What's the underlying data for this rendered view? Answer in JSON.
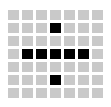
{
  "icon": {
    "name": "plus-grid-icon",
    "description": "Pixel grid forming a plus sign",
    "colors": {
      "background": "#ffffff",
      "cell_off": "#c9c9c9",
      "cell_on": "#000000"
    },
    "grid": {
      "columns": 7,
      "rows": 7,
      "cell_width": 11,
      "cell_height": 10,
      "gap": 3
    },
    "cells": [
      [
        0,
        0,
        0,
        0,
        0,
        0,
        0
      ],
      [
        0,
        0,
        0,
        1,
        0,
        0,
        0
      ],
      [
        0,
        0,
        0,
        0,
        0,
        0,
        0
      ],
      [
        0,
        1,
        1,
        1,
        1,
        1,
        0
      ],
      [
        0,
        0,
        0,
        0,
        0,
        0,
        0
      ],
      [
        0,
        0,
        0,
        1,
        0,
        0,
        0
      ],
      [
        0,
        0,
        0,
        0,
        0,
        0,
        0
      ]
    ]
  }
}
